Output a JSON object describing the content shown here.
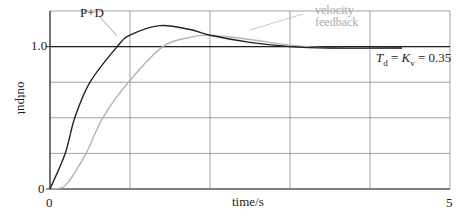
{
  "chart_data": {
    "type": "line",
    "title": "",
    "xlabel": "time/s",
    "ylabel": "output",
    "xlim": [
      0,
      5
    ],
    "ylim": [
      0,
      1.25
    ],
    "grid": true,
    "x_tick_labels": [
      "0",
      "5"
    ],
    "y_tick_labels": [
      "0",
      "1.0"
    ],
    "x_gridlines": [
      0,
      1,
      2,
      3,
      4,
      5
    ],
    "y_gridlines": [
      0,
      0.25,
      0.5,
      0.75,
      1.0,
      1.25
    ],
    "reference_line": {
      "y": 1.0,
      "label": "setpoint"
    },
    "annotation": {
      "text_Td": "T",
      "sub_d": "d",
      "eq1": " = ",
      "text_Kv": "K",
      "sub_v": "v",
      "eq2": " = 0.35"
    },
    "series": [
      {
        "name": "P+D",
        "color": "#222222",
        "x": [
          0,
          0.19,
          0.31,
          0.5,
          0.84,
          1.0,
          1.375,
          1.75,
          2.0,
          2.5,
          3.0,
          3.5,
          4.4
        ],
        "values": [
          0,
          0.25,
          0.5,
          0.75,
          1.0,
          1.08,
          1.147,
          1.12,
          1.08,
          1.03,
          1.0,
          0.99,
          0.99
        ]
      },
      {
        "name": "velocity feedback",
        "color": "#b4b4b4",
        "x": [
          0,
          0.2,
          0.45,
          0.66,
          0.98,
          1.41,
          1.75,
          2.0,
          2.5,
          3.0,
          3.5,
          4.4
        ],
        "values": [
          0,
          0.03,
          0.25,
          0.5,
          0.75,
          1.0,
          1.065,
          1.08,
          1.05,
          1.01,
          0.99,
          0.99
        ]
      }
    ]
  },
  "labels": {
    "pd": "P+D",
    "vel_line1": "velocity",
    "vel_line2": "feedback",
    "y_1": "1.0",
    "y_0": "0",
    "x_0": "0",
    "x_5": "5",
    "xlabel": "time/s",
    "ylabel": "output"
  }
}
